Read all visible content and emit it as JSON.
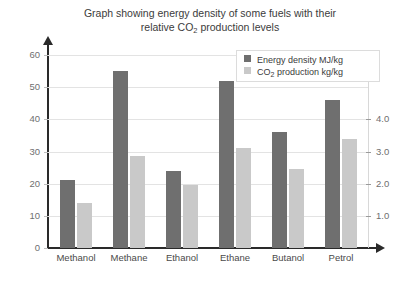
{
  "chart_data": {
    "type": "bar",
    "title": "Graph showing energy density of some fuels with their relative CO2 production levels",
    "title_line1": "Graph showing energy density of some fuels with their",
    "title_line2_pre": "relative CO",
    "title_line2_sub": "2",
    "title_line2_post": " production levels",
    "categories": [
      "Methanol",
      "Methane",
      "Ethanol",
      "Ethane",
      "Butanol",
      "Petrol"
    ],
    "series": [
      {
        "name": "Energy density MJ/kg",
        "axis": "left",
        "color": "#6f6f6f",
        "values": [
          21,
          55,
          24,
          52,
          36,
          46
        ]
      },
      {
        "name": "CO2 production kg/kg",
        "axis": "right",
        "color": "#c9c9c9",
        "values": [
          1.4,
          2.85,
          1.95,
          3.1,
          2.45,
          3.4
        ]
      }
    ],
    "xlabel": "",
    "ylabel": "",
    "ylim": [
      0,
      60
    ],
    "yticks": [
      0,
      10,
      20,
      30,
      40,
      50,
      60
    ],
    "ytick_labels": [
      "0",
      "10",
      "20",
      "30",
      "40",
      "50",
      "60"
    ],
    "y2lim": [
      0,
      6
    ],
    "y2ticks": [
      1.0,
      2.0,
      3.0,
      4.0
    ],
    "y2tick_labels": [
      "1.0",
      "2.0",
      "3.0",
      "4.0"
    ],
    "grid": true,
    "legend_position": "top-right",
    "legend": [
      {
        "label_pre": "Energy density MJ/kg",
        "label_sub": "",
        "label_post": "",
        "color": "#6f6f6f"
      },
      {
        "label_pre": "CO",
        "label_sub": "2",
        "label_post": " production kg/kg",
        "color": "#c9c9c9"
      }
    ]
  }
}
